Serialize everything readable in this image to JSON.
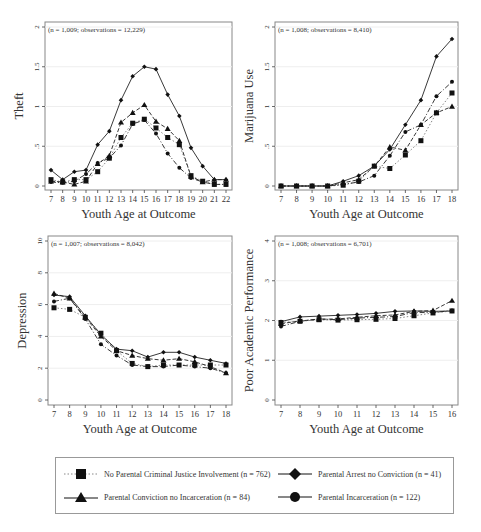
{
  "chart_data": [
    {
      "type": "line",
      "title": "",
      "annotation": "(n = 1,009; observations = 12,229)",
      "xlabel": "Youth Age at Outcome",
      "ylabel": "Theft",
      "ylim": [
        0,
        2
      ],
      "yticks": [
        "0",
        ".5",
        "1",
        "1.5",
        "2"
      ],
      "x": [
        7,
        8,
        9,
        10,
        11,
        12,
        13,
        14,
        15,
        16,
        17,
        18,
        19,
        20,
        21,
        22
      ],
      "series": [
        {
          "name": "No Parental Criminal Justice Involvement",
          "values": [
            0.08,
            0.05,
            0.08,
            0.08,
            0.18,
            0.35,
            0.61,
            0.79,
            0.84,
            0.73,
            0.61,
            0.52,
            0.13,
            0.06,
            0.02,
            0.02
          ]
        },
        {
          "name": "Parental Arrest no Conviction",
          "values": [
            0.2,
            0.08,
            0.18,
            0.2,
            0.52,
            0.69,
            1.08,
            1.38,
            1.5,
            1.47,
            1.15,
            0.88,
            0.48,
            0.25,
            0.08,
            0.08
          ]
        },
        {
          "name": "Parental Conviction no Incarceration",
          "values": [
            0.06,
            0.05,
            0.02,
            0.06,
            0.28,
            0.38,
            0.8,
            0.92,
            1.02,
            0.81,
            0.72,
            0.57,
            0.12,
            0.05,
            0.08,
            0.08
          ]
        },
        {
          "name": "Parental Incarceration",
          "values": [
            0.05,
            0.04,
            0.06,
            0.15,
            0.29,
            0.35,
            0.51,
            0.78,
            0.83,
            0.66,
            0.41,
            0.23,
            0.1,
            0.05,
            0.02,
            0.02
          ]
        }
      ],
      "grid": true
    },
    {
      "type": "line",
      "title": "",
      "annotation": "(n = 1,008; observations = 8,410)",
      "xlabel": "Youth Age at Outcome",
      "ylabel": "Marijuana Use",
      "ylim": [
        0,
        2
      ],
      "yticks": [
        "0",
        ".5",
        "1",
        "1.5",
        "2"
      ],
      "x": [
        7,
        8,
        9,
        10,
        11,
        12,
        13,
        14,
        15,
        16,
        17,
        18
      ],
      "series": [
        {
          "name": "No Parental Criminal Justice Involvement",
          "values": [
            0,
            0,
            0,
            0,
            0.01,
            0.06,
            0.25,
            0.22,
            0.39,
            0.57,
            0.92,
            1.17
          ]
        },
        {
          "name": "Parental Arrest no Conviction",
          "values": [
            0,
            0,
            0,
            0,
            0.06,
            0.13,
            0.25,
            0.46,
            0.77,
            1.08,
            1.63,
            1.85
          ]
        },
        {
          "name": "Parental Conviction no Incarceration",
          "values": [
            0,
            0,
            0,
            0,
            0.04,
            0.08,
            0.25,
            0.49,
            0.45,
            0.77,
            0.92,
            1.0
          ]
        },
        {
          "name": "Parental Incarceration",
          "values": [
            0,
            0,
            0,
            0,
            0.02,
            0.05,
            0.13,
            0.38,
            0.68,
            0.77,
            1.13,
            1.31
          ]
        }
      ],
      "grid": true
    },
    {
      "type": "line",
      "title": "",
      "annotation": "(n = 1,007; observations = 8,042)",
      "xlabel": "Youth Age at Outcome",
      "ylabel": "Depression",
      "ylim": [
        0,
        10
      ],
      "yticks": [
        "0",
        "2",
        "4",
        "6",
        "8",
        "10"
      ],
      "x": [
        7,
        8,
        9,
        10,
        11,
        12,
        13,
        14,
        15,
        16,
        17,
        18
      ],
      "series": [
        {
          "name": "No Parental Criminal Justice Involvement",
          "values": [
            5.8,
            5.7,
            5.2,
            4.2,
            3.1,
            2.3,
            2.1,
            2.2,
            2.2,
            2.2,
            2.2,
            2.2
          ]
        },
        {
          "name": "Parental Arrest no Conviction",
          "values": [
            6.6,
            6.5,
            5.3,
            4.1,
            3.2,
            3.1,
            2.7,
            3.0,
            3.0,
            2.7,
            2.5,
            2.3
          ]
        },
        {
          "name": "Parental Conviction no Incarceration",
          "values": [
            6.7,
            6.4,
            5.2,
            4.0,
            3.1,
            2.8,
            2.6,
            2.5,
            2.6,
            2.4,
            2.1,
            1.7
          ]
        },
        {
          "name": "Parental Incarceration",
          "values": [
            6.2,
            6.4,
            5.1,
            3.5,
            2.8,
            2.2,
            2.1,
            2.1,
            2.2,
            2.1,
            2.0,
            1.7
          ]
        }
      ],
      "grid": true
    },
    {
      "type": "line",
      "title": "",
      "annotation": "(n = 1,008; observations = 6,701)",
      "xlabel": "Youth Age at Outcome",
      "ylabel": "Poor Academic Performance",
      "ylim": [
        0,
        4
      ],
      "yticks": [
        "0",
        "1",
        "2",
        "3",
        "4"
      ],
      "x": [
        7,
        8,
        9,
        10,
        11,
        12,
        13,
        14,
        15,
        16
      ],
      "series": [
        {
          "name": "No Parental Criminal Justice Involvement",
          "values": [
            1.95,
            1.98,
            2.02,
            2.01,
            2.02,
            2.03,
            2.05,
            2.12,
            2.19,
            2.24
          ]
        },
        {
          "name": "Parental Arrest no Conviction",
          "values": [
            1.97,
            2.09,
            2.11,
            2.13,
            2.15,
            2.18,
            2.23,
            2.24,
            2.23,
            2.24
          ]
        },
        {
          "name": "Parental Conviction no Incarceration",
          "values": [
            1.92,
            1.99,
            2.03,
            2.04,
            2.08,
            2.12,
            2.14,
            2.23,
            2.25,
            2.5
          ]
        },
        {
          "name": "Parental Incarceration",
          "values": [
            1.85,
            1.98,
            2.04,
            2.02,
            2.06,
            2.08,
            2.1,
            2.2,
            2.2,
            2.25
          ]
        }
      ],
      "grid": true
    }
  ],
  "legend": {
    "items": [
      {
        "label": "No Parental Criminal Justice Involvement (n = 762)",
        "marker": "square",
        "line": "dotted"
      },
      {
        "label": "Parental Arrest no Conviction (n = 41)",
        "marker": "diamond",
        "line": "solid"
      },
      {
        "label": "Parental Conviction no Incarceration (n = 84)",
        "marker": "triangle",
        "line": "solid"
      },
      {
        "label": "Parental Incarceration (n = 122)",
        "marker": "circle",
        "line": "solid"
      }
    ]
  }
}
